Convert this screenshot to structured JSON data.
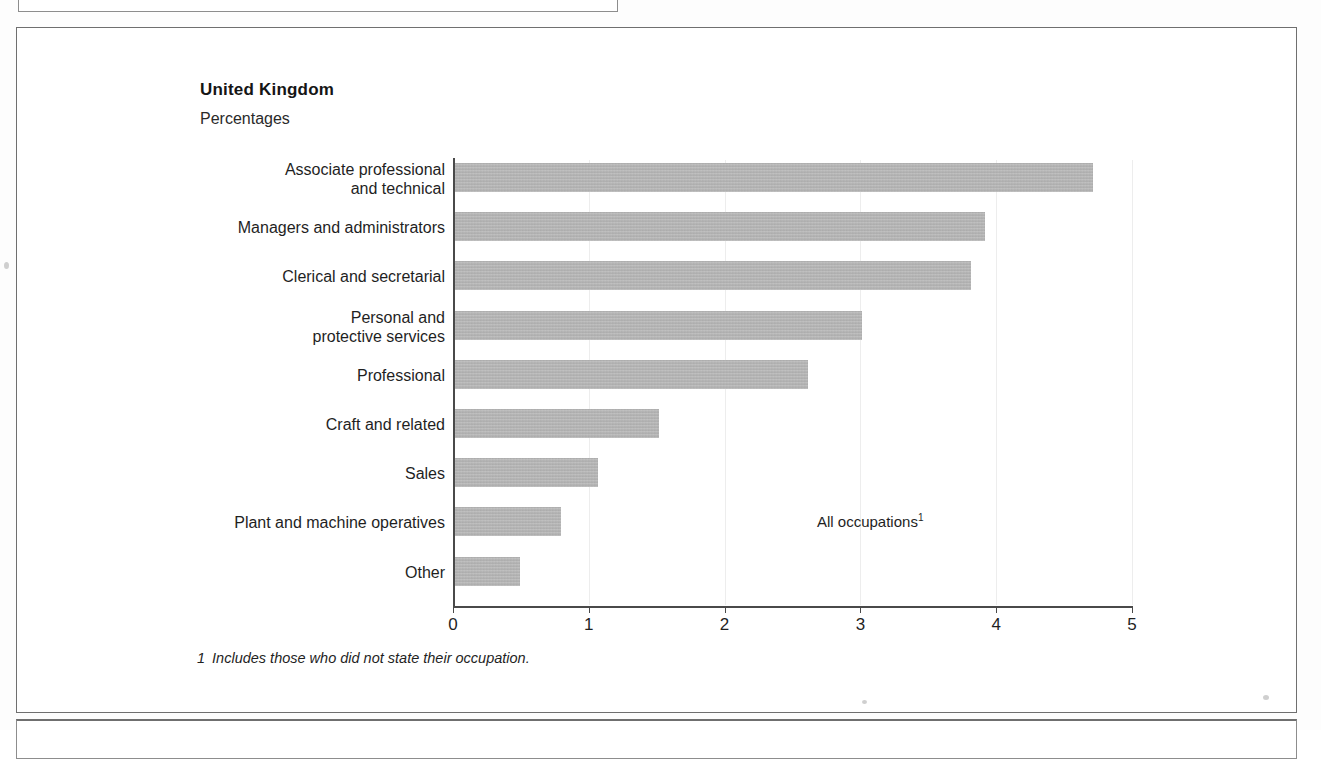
{
  "figure": {
    "title": "United Kingdom",
    "units": "Percentages",
    "annotation": "All occupations",
    "annotation_footnote_marker": "1",
    "footnote_marker": "1",
    "footnote_text": "Includes those who did not state their occupation.",
    "bar_color": "#b4b4b4",
    "frame_color": "#6f6f6f"
  },
  "chart_data": {
    "type": "bar",
    "orientation": "horizontal",
    "title": "United Kingdom",
    "subtitle": "Percentages",
    "xlabel": "",
    "ylabel": "",
    "xlim": [
      0,
      5
    ],
    "xticks": [
      "0",
      "1",
      "2",
      "3",
      "4",
      "5"
    ],
    "grid": true,
    "legend": "none",
    "annotations": [
      "All occupations1"
    ],
    "categories": [
      "Associate professional\nand technical",
      "Managers and administrators",
      "Clerical and secretarial",
      "Personal and\nprotective services",
      "Professional",
      "Craft and related",
      "Sales",
      "Plant and machine operatives",
      "Other"
    ],
    "values": [
      4.7,
      3.9,
      3.8,
      3.0,
      2.6,
      1.5,
      1.05,
      0.78,
      0.48
    ]
  }
}
